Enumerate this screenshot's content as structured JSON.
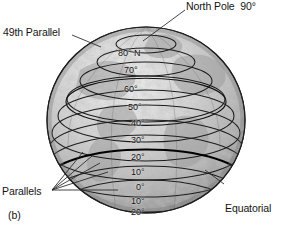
{
  "figure": {
    "caption": "(b)",
    "annotations": {
      "north_pole": "North Pole  90°",
      "forty_ninth_parallel": "49th Parallel",
      "parallels": "Parallels",
      "equatorial_parallel_line1": "Equatorial",
      "equatorial_parallel_line2": "parallel"
    },
    "latitude_labels": [
      {
        "text": "80° N",
        "x": 118,
        "y": 48
      },
      {
        "text": "70°",
        "x": 124,
        "y": 65
      },
      {
        "text": "60°",
        "x": 124,
        "y": 84
      },
      {
        "text": "50°",
        "x": 128,
        "y": 102
      },
      {
        "text": "40°",
        "x": 131,
        "y": 118
      },
      {
        "text": "30°",
        "x": 131,
        "y": 135
      },
      {
        "text": "20°",
        "x": 131,
        "y": 152
      },
      {
        "text": "10°",
        "x": 131,
        "y": 167
      },
      {
        "text": "0°",
        "x": 136,
        "y": 182
      },
      {
        "text": "10°",
        "x": 131,
        "y": 196
      },
      {
        "text": "20°",
        "x": 131,
        "y": 207
      }
    ],
    "colors": {
      "background": "#ffffff",
      "text": "#141414",
      "globe_light": "#d8d8d8",
      "globe_mid": "#b4b4b4",
      "globe_dark": "#8e8e8e",
      "parallel_line": "#1a1a1a",
      "equator_line": "#000000",
      "leader_line": "#2a2a2a"
    }
  }
}
